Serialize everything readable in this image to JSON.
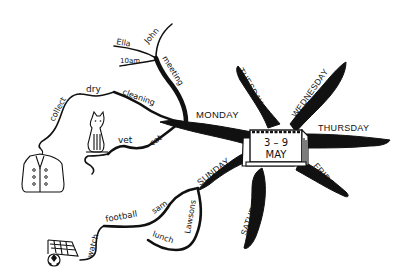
{
  "diagram": {
    "type": "mind-map",
    "center": {
      "label_top": "3 – 9",
      "label_bottom": "MAY",
      "icon": "calendar-icon"
    },
    "days": [
      {
        "label": "MONDAY",
        "branches": [
          {
            "label": "meeting",
            "children": [
              {
                "label": "John"
              },
              {
                "label": "Ella"
              },
              {
                "label": "10am"
              }
            ]
          },
          {
            "label": "cleaning",
            "children": [
              {
                "label": "dry",
                "children": [
                  {
                    "label": "collect",
                    "icon": "jacket-icon"
                  }
                ]
              }
            ]
          },
          {
            "label": "cat",
            "children": [
              {
                "label": "vet",
                "icon": "cat-icon"
              }
            ]
          }
        ]
      },
      {
        "label": "TUESDAY",
        "branches": []
      },
      {
        "label": "WEDNESDAY",
        "branches": []
      },
      {
        "label": "THURSDAY",
        "branches": []
      },
      {
        "label": "FRIDAY",
        "branches": []
      },
      {
        "label": "SATURDAY",
        "branches": []
      },
      {
        "label": "SUNDAY",
        "branches": [
          {
            "label": "sam",
            "children": [
              {
                "label": "football",
                "children": [
                  {
                    "label": "watch",
                    "icon": "football-goal-icon"
                  }
                ]
              }
            ]
          },
          {
            "label": "Lawsons",
            "children": [
              {
                "label": "lunch"
              }
            ]
          }
        ]
      }
    ]
  },
  "labels": {
    "monday": "MONDAY",
    "tuesday": "TUESDAY",
    "wednesday": "WEDNESDAY",
    "thursday": "THURSDAY",
    "friday": "FRIDAY",
    "saturday": "SATURDAY",
    "sunday": "SUNDAY",
    "meeting": "meeting",
    "john": "John",
    "ella": "Ella",
    "ten_am": "10am",
    "cleaning": "cleaning",
    "dry": "dry",
    "collect": "collect",
    "cat": "cat",
    "vet": "vet",
    "sam": "sam",
    "football": "football",
    "watch": "watch",
    "lawsons": "Lawsons",
    "lunch": "lunch",
    "calendar_dates": "3 – 9",
    "calendar_month": "MAY"
  }
}
